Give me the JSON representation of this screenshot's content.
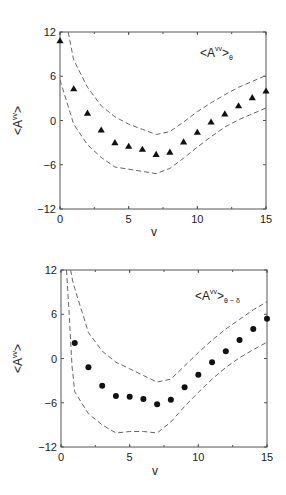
{
  "chart_data": [
    {
      "type": "scatter",
      "marker": "triangle",
      "legend": {
        "main": "<A",
        "sup": "vv",
        "close": ">",
        "sub": "θ"
      },
      "xlabel": "v",
      "ylabel": "<A",
      "ylabel_sup": "vv",
      "ylabel_close": ">",
      "xlim": [
        0,
        15
      ],
      "ylim": [
        -12,
        12
      ],
      "xticks": [
        0,
        5,
        10,
        15
      ],
      "xtick_labels": [
        "0",
        "5",
        "10",
        "15"
      ],
      "yticks": [
        -12,
        -6,
        0,
        6,
        12
      ],
      "ytick_labels": [
        "−12",
        "−6",
        "0",
        "6",
        "12"
      ],
      "grid": false,
      "legend_position": "top-right",
      "series": [
        {
          "name": "mean",
          "x": [
            0,
            1,
            2,
            3,
            4,
            5,
            6,
            7,
            8,
            9,
            10,
            11,
            12,
            13,
            14,
            15
          ],
          "y": [
            10.8,
            4.3,
            1.0,
            -1.3,
            -3.0,
            -3.5,
            -3.9,
            -4.6,
            -4.3,
            -2.9,
            -1.6,
            -0.2,
            0.9,
            2.0,
            3.1,
            4.0
          ]
        }
      ],
      "bands": [
        {
          "name": "upper",
          "x": [
            0.6,
            1,
            2,
            3,
            4,
            5,
            6,
            7,
            8,
            9,
            10,
            11,
            12,
            13,
            14,
            15
          ],
          "y": [
            12,
            8.2,
            4.5,
            2.0,
            0.5,
            -0.5,
            -1.2,
            -1.9,
            -1.5,
            -0.2,
            1.2,
            2.4,
            3.5,
            4.5,
            5.3,
            6.1
          ]
        },
        {
          "name": "lower",
          "x": [
            0,
            1,
            2,
            3,
            4,
            5,
            6,
            7,
            8,
            9,
            10,
            11,
            12,
            13,
            14,
            15
          ],
          "y": [
            5.5,
            -0.5,
            -3.3,
            -5.0,
            -6.3,
            -6.6,
            -6.9,
            -7.2,
            -6.5,
            -5.1,
            -3.6,
            -2.2,
            -0.9,
            0.1,
            0.9,
            1.7
          ]
        }
      ]
    },
    {
      "type": "scatter",
      "marker": "circle",
      "legend": {
        "main": "<A",
        "sup": "vv",
        "close": ">",
        "sub": "θ − δ"
      },
      "xlabel": "v",
      "ylabel": "<A",
      "ylabel_sup": "vv",
      "ylabel_close": ">",
      "xlim": [
        0,
        15
      ],
      "ylim": [
        -12,
        12
      ],
      "xticks": [
        0,
        5,
        10,
        15
      ],
      "xtick_labels": [
        "0",
        "5",
        "10",
        "15"
      ],
      "yticks": [
        -12,
        -6,
        0,
        6,
        12
      ],
      "ytick_labels": [
        "−12",
        "−6",
        "0",
        "6",
        "12"
      ],
      "grid": false,
      "legend_position": "top-right",
      "series": [
        {
          "name": "mean",
          "x": [
            1,
            2,
            3,
            4,
            5,
            6,
            7,
            8,
            9,
            10,
            11,
            12,
            13,
            14,
            15
          ],
          "y": [
            2.1,
            -1.2,
            -3.7,
            -5.1,
            -5.2,
            -5.5,
            -6.2,
            -5.6,
            -3.9,
            -2.2,
            -0.5,
            1.0,
            2.5,
            4.0,
            5.4
          ]
        }
      ],
      "bands": [
        {
          "name": "upper",
          "x": [
            0.7,
            0.85,
            1,
            2,
            3,
            4,
            5,
            6,
            7,
            8,
            9,
            10,
            11,
            12,
            13,
            14,
            15
          ],
          "y": [
            12,
            10.5,
            9.5,
            3.5,
            1.0,
            -0.5,
            -1.4,
            -2.3,
            -3.2,
            -2.8,
            -1.0,
            0.8,
            2.5,
            4.0,
            5.3,
            6.6,
            7.7
          ]
        },
        {
          "name": "lower",
          "x": [
            0.4,
            0.6,
            0.8,
            1,
            2,
            3,
            4,
            5,
            6,
            7,
            8,
            9,
            10,
            11,
            12,
            13,
            14,
            15
          ],
          "y": [
            12,
            6,
            -1,
            -4.5,
            -7.5,
            -9.0,
            -10.1,
            -9.9,
            -9.9,
            -10.1,
            -8.6,
            -6.5,
            -4.6,
            -2.8,
            -1.2,
            0.1,
            1.2,
            2.2
          ]
        }
      ]
    }
  ]
}
